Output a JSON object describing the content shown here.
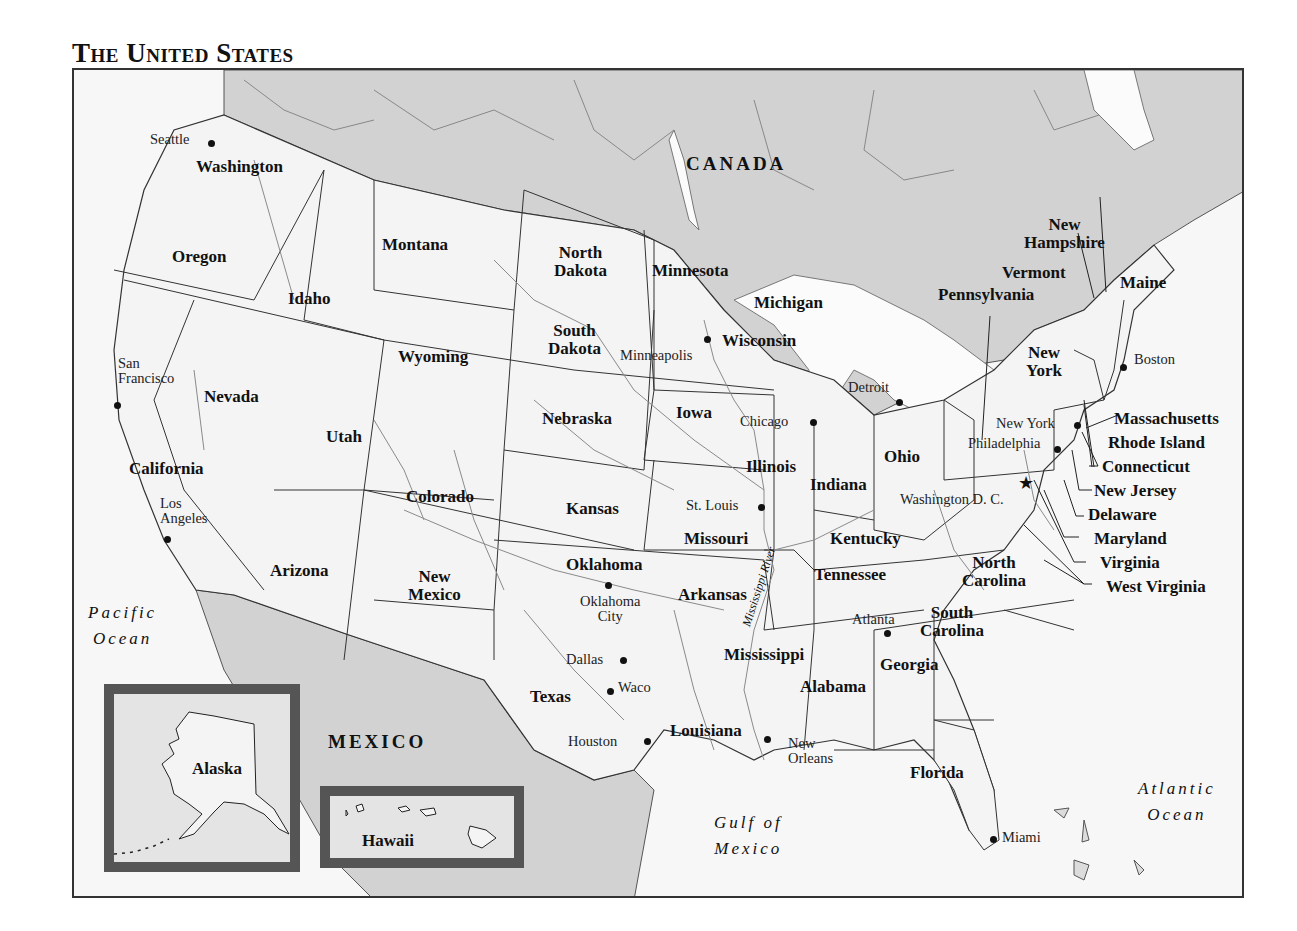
{
  "title": "The United States",
  "colors": {
    "us_land": "#f4f4f4",
    "foreign_land": "#d2d2d2",
    "water": "#fbfbfb",
    "border": "#333333",
    "river": "#8a8a8a",
    "inset_frame": "#555555"
  },
  "countries": {
    "canada": "CANADA",
    "mexico": "MEXICO"
  },
  "water_bodies": {
    "pacific": [
      "Pacific",
      "Ocean"
    ],
    "atlantic": [
      "Atlantic",
      "Ocean"
    ],
    "gulf": [
      "Gulf of",
      "Mexico"
    ],
    "mississippi_river": "Mississippi River"
  },
  "states": {
    "washington": "Washington",
    "oregon": "Oregon",
    "california": "California",
    "nevada": "Nevada",
    "idaho": "Idaho",
    "montana": "Montana",
    "wyoming": "Wyoming",
    "utah": "Utah",
    "arizona": "Arizona",
    "colorado": "Colorado",
    "new_mexico": [
      "New",
      "Mexico"
    ],
    "north_dakota": [
      "North",
      "Dakota"
    ],
    "south_dakota": [
      "South",
      "Dakota"
    ],
    "nebraska": "Nebraska",
    "kansas": "Kansas",
    "oklahoma": "Oklahoma",
    "texas": "Texas",
    "minnesota": "Minnesota",
    "iowa": "Iowa",
    "missouri": "Missouri",
    "arkansas": "Arkansas",
    "louisiana": "Louisiana",
    "wisconsin": "Wisconsin",
    "illinois": "Illinois",
    "michigan": "Michigan",
    "indiana": "Indiana",
    "ohio": "Ohio",
    "kentucky": "Kentucky",
    "tennessee": "Tennessee",
    "mississippi": "Mississippi",
    "alabama": "Alabama",
    "georgia": "Georgia",
    "florida": "Florida",
    "south_carolina": [
      "South",
      "Carolina"
    ],
    "north_carolina": [
      "North",
      "Carolina"
    ],
    "pennsylvania": "Pennsylvania",
    "new_york": [
      "New",
      "York"
    ],
    "new_hampshire": [
      "New",
      "Hampshire"
    ],
    "vermont": "Vermont",
    "maine": "Maine",
    "massachusetts": "Massachusetts",
    "rhode_island": "Rhode Island",
    "connecticut": "Connecticut",
    "new_jersey": "New Jersey",
    "delaware": "Delaware",
    "maryland": "Maryland",
    "virginia": "Virginia",
    "west_virginia": "West Virginia",
    "alaska": "Alaska",
    "hawaii": "Hawaii"
  },
  "cities": {
    "seattle": "Seattle",
    "san_francisco": [
      "San",
      "Francisco"
    ],
    "los_angeles": [
      "Los",
      "Angeles"
    ],
    "minneapolis": "Minneapolis",
    "chicago": "Chicago",
    "detroit": "Detroit",
    "st_louis": "St. Louis",
    "oklahoma_city": [
      "Oklahoma",
      "City"
    ],
    "dallas": "Dallas",
    "waco": "Waco",
    "houston": "Houston",
    "new_orleans": [
      "New",
      "Orleans"
    ],
    "atlanta": "Atlanta",
    "miami": "Miami",
    "washington_dc": "Washington D. C.",
    "philadelphia": "Philadelphia",
    "new_york_city": "New York",
    "boston": "Boston"
  }
}
